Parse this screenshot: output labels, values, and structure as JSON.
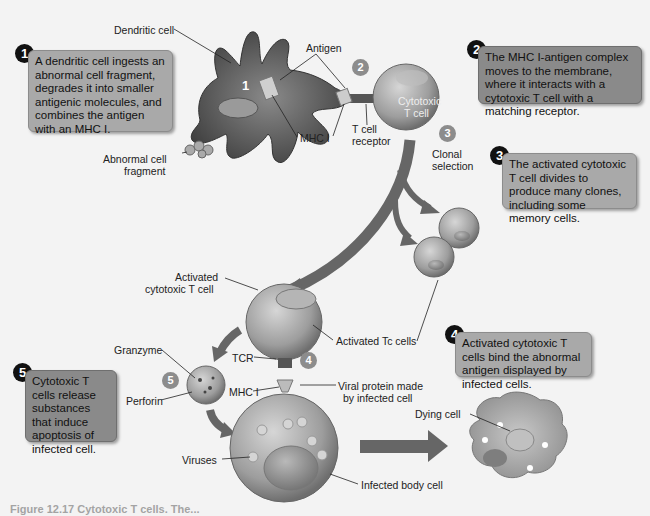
{
  "steps": [
    {
      "number": "1",
      "text": "A dendritic cell ingests an abnormal cell fragment, degrades it into smaller antigenic molecules, and combines the antigen with an MHC I."
    },
    {
      "number": "2",
      "text": "The MHC I-antigen complex moves to the membrane, where it interacts with a cytotoxic T cell with a matching receptor."
    },
    {
      "number": "3",
      "text": "The activated cytotoxic T cell divides to produce many clones, including some memory cells."
    },
    {
      "number": "4",
      "text": "Activated cytotoxic T cells bind the abnormal antigen displayed by infected cells."
    },
    {
      "number": "5",
      "text": "Cytotoxic T cells release substances that induce apoptosis of infected cell."
    }
  ],
  "diagram_markers": [
    "1",
    "2",
    "3",
    "4",
    "5"
  ],
  "labels": {
    "dendritic_cell": "Dendritic cell",
    "antigen": "Antigen",
    "mhc1_top": "MHC I",
    "t_cell_receptor_line1": "T cell",
    "t_cell_receptor_line2": "receptor",
    "cytotoxic_line1": "Cytotoxic",
    "cytotoxic_line2": "T cell",
    "abnormal_line1": "Abnormal cell",
    "abnormal_line2": "fragment",
    "clonal_line1": "Clonal",
    "clonal_line2": "selection",
    "activated_line1": "Activated",
    "activated_line2": "cytotoxic T cell",
    "activated_tc": "Activated Tc cells",
    "granzyme": "Granzyme",
    "perforin": "Perforin",
    "tcr": "TCR",
    "mhc1_bottom": "MHC I",
    "viral_line1": "Viral protein made",
    "viral_line2": "by infected cell",
    "viruses": "Viruses",
    "infected_body_cell": "Infected body cell",
    "dying_cell": "Dying cell"
  },
  "caption": "Figure 12.17 Cytotoxic T cells. The..."
}
